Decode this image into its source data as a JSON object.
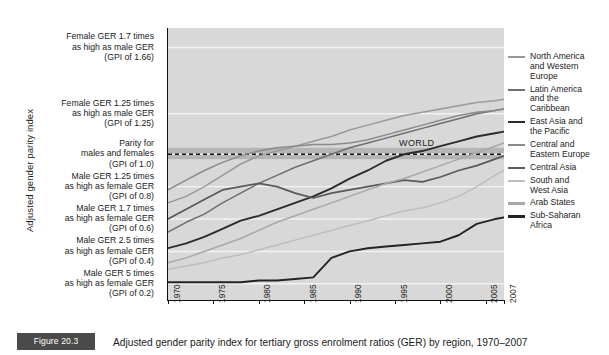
{
  "chart_data": {
    "type": "line",
    "title": "Adjusted gender parity index for tertiary gross enrolment ratios (GER) by region, 1970–2007",
    "xlabel": "",
    "ylabel": "Adjusted gender parity index",
    "xlim": [
      1970,
      2007
    ],
    "ylim": [
      0.1,
      1.78
    ],
    "grid": true,
    "legend_position": "right",
    "xtick_labels": [
      "1970",
      "1975",
      "1980",
      "1985",
      "1990",
      "1995",
      "2000",
      "2005",
      "2007"
    ],
    "xtick_values": [
      1970,
      1975,
      1980,
      1985,
      1990,
      1995,
      2000,
      2005,
      2007
    ],
    "ytick_values": [
      1.66,
      1.25,
      1.0,
      0.8,
      0.6,
      0.4,
      0.2
    ],
    "ytick_labels": [
      "Female GER 1.7 times\nas high as male GER\n(GPI of 1.66)",
      "Female GER 1.25 times\nas high as male GER\n(GPI of 1.25)",
      "Parity for\nmales and females\n(GPI of 1.0)",
      "Male GER 1.25 times\nas high as female GER\n(GPI of 0.8)",
      "Male GER 1.7 times\nas high as female GER\n(GPI of 0.6)",
      "Male GER 2.5 times\nas high as female GER\n(GPI of 0.4)",
      "Male GER 5 times\nas high as female GER\n(GPI of 0.2)"
    ],
    "annotations": [
      {
        "text": "WORLD",
        "x": 1997,
        "y": 0.93
      }
    ],
    "parity_band": {
      "low": 0.97,
      "high": 1.04,
      "dashed_line": 1.0,
      "color": "#b5b5b5"
    },
    "series": [
      {
        "name": "North America and Western Europe",
        "color": "#9a9a9a",
        "width": 1.5,
        "x": [
          1970,
          1972,
          1974,
          1976,
          1978,
          1980,
          1982,
          1984,
          1986,
          1988,
          1990,
          1992,
          1994,
          1996,
          1998,
          2000,
          2002,
          2004,
          2006,
          2007
        ],
        "values": [
          0.7,
          0.74,
          0.8,
          0.87,
          0.94,
          0.99,
          1.02,
          1.05,
          1.08,
          1.11,
          1.15,
          1.18,
          1.21,
          1.24,
          1.26,
          1.28,
          1.3,
          1.32,
          1.33,
          1.34
        ]
      },
      {
        "name": "Latin America and the Caribbean",
        "color": "#6f6f6f",
        "width": 1.5,
        "x": [
          1970,
          1972,
          1974,
          1976,
          1978,
          1980,
          1982,
          1984,
          1986,
          1988,
          1990,
          1992,
          1994,
          1996,
          1998,
          2000,
          2002,
          2004,
          2006,
          2007
        ],
        "values": [
          0.52,
          0.58,
          0.63,
          0.7,
          0.76,
          0.82,
          0.87,
          0.92,
          0.96,
          1.0,
          1.04,
          1.07,
          1.1,
          1.13,
          1.16,
          1.19,
          1.22,
          1.25,
          1.27,
          1.28
        ]
      },
      {
        "name": "East Asia and the Pacific",
        "color": "#2b2b2b",
        "width": 1.9,
        "x": [
          1970,
          1972,
          1974,
          1976,
          1978,
          1980,
          1982,
          1984,
          1986,
          1988,
          1990,
          1992,
          1994,
          1996,
          1998,
          2000,
          2002,
          2004,
          2006,
          2007
        ],
        "values": [
          0.42,
          0.45,
          0.49,
          0.54,
          0.59,
          0.62,
          0.66,
          0.7,
          0.74,
          0.79,
          0.85,
          0.9,
          0.96,
          1.0,
          1.02,
          1.05,
          1.08,
          1.11,
          1.13,
          1.14
        ]
      },
      {
        "name": "Central and Eastern Europe",
        "color": "#8a8a8a",
        "width": 1.5,
        "x": [
          1970,
          1972,
          1974,
          1976,
          1978,
          1980,
          1982,
          1984,
          1986,
          1988,
          1990,
          1992,
          1994,
          1996,
          1998,
          2000,
          2002,
          2004,
          2006,
          2007
        ],
        "values": [
          0.78,
          0.84,
          0.9,
          0.95,
          0.99,
          1.02,
          1.04,
          1.05,
          1.06,
          1.06,
          1.07,
          1.09,
          1.12,
          1.15,
          1.18,
          1.21,
          1.24,
          1.26,
          1.27,
          1.28
        ]
      },
      {
        "name": "Central Asia",
        "color": "#595959",
        "width": 1.7,
        "x": [
          1970,
          1972,
          1974,
          1976,
          1978,
          1980,
          1982,
          1984,
          1986,
          1988,
          1990,
          1992,
          1994,
          1996,
          1998,
          2000,
          2002,
          2004,
          2006,
          2007
        ],
        "values": [
          0.6,
          0.66,
          0.72,
          0.78,
          0.8,
          0.82,
          0.8,
          0.76,
          0.73,
          0.76,
          0.78,
          0.8,
          0.82,
          0.84,
          0.83,
          0.86,
          0.9,
          0.93,
          0.97,
          0.99
        ]
      },
      {
        "name": "South and West Asia",
        "color": "#bdbdbd",
        "width": 1.5,
        "x": [
          1970,
          1972,
          1974,
          1976,
          1978,
          1980,
          1982,
          1984,
          1986,
          1988,
          1990,
          1992,
          1994,
          1996,
          1998,
          2000,
          2002,
          2004,
          2006,
          2007
        ],
        "values": [
          0.29,
          0.31,
          0.33,
          0.36,
          0.38,
          0.41,
          0.44,
          0.47,
          0.5,
          0.53,
          0.56,
          0.59,
          0.62,
          0.65,
          0.67,
          0.7,
          0.74,
          0.8,
          0.87,
          0.9
        ]
      },
      {
        "name": "Arab States",
        "color": "#a8a8a8",
        "width": 1.5,
        "x": [
          1970,
          1972,
          1974,
          1976,
          1978,
          1980,
          1982,
          1984,
          1986,
          1988,
          1990,
          1992,
          1994,
          1996,
          1998,
          2000,
          2002,
          2004,
          2006,
          2007
        ],
        "values": [
          0.33,
          0.36,
          0.4,
          0.44,
          0.48,
          0.53,
          0.58,
          0.62,
          0.66,
          0.7,
          0.74,
          0.78,
          0.82,
          0.85,
          0.89,
          0.93,
          0.97,
          1.01,
          1.05,
          1.07
        ]
      },
      {
        "name": "Sub-Saharan Africa",
        "color": "#232323",
        "width": 1.9,
        "x": [
          1970,
          1972,
          1974,
          1976,
          1978,
          1980,
          1982,
          1984,
          1986,
          1988,
          1990,
          1992,
          1994,
          1996,
          1998,
          2000,
          2002,
          2004,
          2006,
          2007
        ],
        "values": [
          0.21,
          0.21,
          0.21,
          0.21,
          0.21,
          0.22,
          0.22,
          0.23,
          0.24,
          0.36,
          0.4,
          0.42,
          0.43,
          0.44,
          0.45,
          0.46,
          0.5,
          0.57,
          0.6,
          0.61
        ]
      }
    ]
  },
  "axis": {
    "y_title": "Adjusted gender parity index"
  },
  "legend": {
    "items": [
      {
        "label": "North America\nand Western\nEurope",
        "color": "#9a9a9a"
      },
      {
        "label": "Latin America\nand the\nCaribbean",
        "color": "#6f6f6f"
      },
      {
        "label": "East Asia and\nthe Pacific",
        "color": "#2b2b2b"
      },
      {
        "label": "Central and\nEastern Europe",
        "color": "#8a8a8a"
      },
      {
        "label": "Central Asia",
        "color": "#595959"
      },
      {
        "label": "South and\nWest Asia",
        "color": "#bdbdbd"
      },
      {
        "label": "Arab States",
        "color": "#a8a8a8"
      },
      {
        "label": "Sub-Saharan\nAfrica",
        "color": "#232323"
      }
    ]
  },
  "world_annotation": "WORLD",
  "caption": {
    "figure_number": "Figure 20.3",
    "text": "Adjusted gender parity index for tertiary gross enrolment ratios (GER) by region, 1970–2007"
  },
  "colors": {
    "plot_background": "#d8d8d8",
    "gridline": "#f2f2f2",
    "parity_band": "#b5b5b5",
    "axis": "#111111",
    "figure_box": "#4a4a4a"
  }
}
